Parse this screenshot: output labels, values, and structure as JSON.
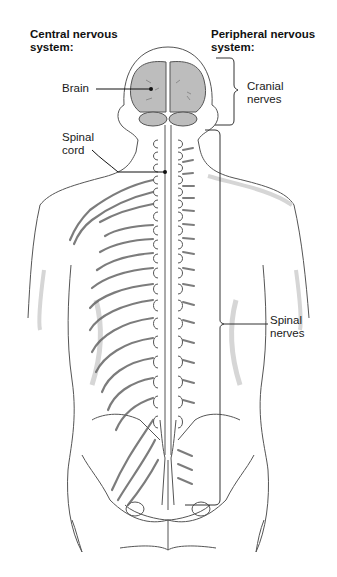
{
  "diagram": {
    "headers": {
      "left": [
        "Central nervous",
        "system:"
      ],
      "right": [
        "Peripheral nervous",
        "system:"
      ]
    },
    "labels": {
      "brain": "Brain",
      "spinal_cord": [
        "Spinal",
        "cord"
      ],
      "cranial_nerves": [
        "Cranial",
        "nerves"
      ],
      "spinal_nerves": [
        "Spinal",
        "nerves"
      ]
    },
    "colors": {
      "outline": "#555555",
      "brain_fill": "#bdbdbd",
      "shadow": "#d6d6d6",
      "label_text": "#1a1a1a"
    }
  }
}
